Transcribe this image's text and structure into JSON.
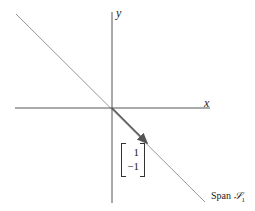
{
  "axes": {
    "x_label": "x",
    "y_label": "y"
  },
  "vector": {
    "components": [
      "1",
      "−1"
    ],
    "direction": [
      1,
      -1
    ]
  },
  "line": {
    "label_prefix": "Span ",
    "label_set": "𝒮",
    "label_sub": "1",
    "slope": -1
  },
  "colors": {
    "axis": "#555555",
    "line": "#888888",
    "vector": "#555555"
  }
}
